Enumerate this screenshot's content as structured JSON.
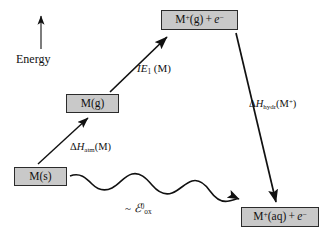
{
  "diagram": {
    "axis": {
      "energy_label": "Energy",
      "arrow_icon": "up-arrow-icon",
      "direction": "up"
    },
    "colors": {
      "box_fill": "#c9c9c9",
      "box_stroke": "#2b2b2b",
      "arrow_stroke": "#111111",
      "background": "#ffffff",
      "text": "#111111"
    },
    "boxes": [
      {
        "id": "mplus-g",
        "label_parts": {
          "species": "M",
          "charge": "+",
          "phase": "(g)",
          "plus": " + ",
          "electron": "e",
          "electron_charge": "−"
        },
        "label_plain": "M⁺(g) + e⁻",
        "x": 161,
        "y": 10,
        "w": 77,
        "h": 20
      },
      {
        "id": "m-g",
        "label_plain": "M(g)",
        "x": 66,
        "y": 94,
        "w": 53,
        "h": 19
      },
      {
        "id": "m-s",
        "label_plain": "M(s)",
        "x": 14,
        "y": 167,
        "w": 53,
        "h": 19
      },
      {
        "id": "mplus-aq",
        "label_parts": {
          "species": "M",
          "charge": "+",
          "phase": "(aq)",
          "plus": " + ",
          "electron": "e",
          "electron_charge": "−"
        },
        "label_plain": "M⁺(aq) + e⁻",
        "x": 241,
        "y": 207,
        "w": 78,
        "h": 20
      }
    ],
    "arrows": [
      {
        "id": "atomization",
        "from": "m-s",
        "to": "m-g",
        "style": "straight",
        "label_plain": "ΔH_atm(M)",
        "label_base": "ΔH",
        "label_sub": "atm",
        "label_tail": "(M)"
      },
      {
        "id": "ionization",
        "from": "m-g",
        "to": "mplus-g",
        "style": "straight",
        "label_plain": "IE₁ (M)",
        "label_base": "IE",
        "label_sub": "1",
        "label_tail": " (M)"
      },
      {
        "id": "hydration",
        "from": "mplus-g",
        "to": "mplus-aq",
        "style": "straight",
        "label_plain": "ΔH_hydr(M⁺)",
        "label_base": "ΔH",
        "label_sub": "hydr",
        "label_tail": "(M",
        "label_sup": "+",
        "label_close": ")"
      },
      {
        "id": "oxidation-overall",
        "from": "m-s",
        "to": "mplus-aq",
        "style": "wavy",
        "label_plain": "~ ℰ°ox",
        "label_tilde": "~ ",
        "label_base": "ℰ",
        "label_sup": "0",
        "label_sub": "ox"
      }
    ]
  }
}
